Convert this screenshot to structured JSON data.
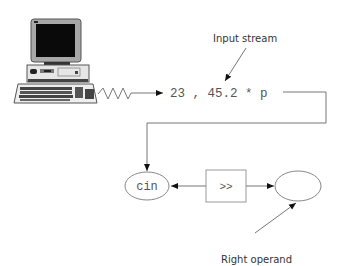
{
  "diagram": {
    "input_stream_label": "Input stream",
    "stream_content": "23 , 45.2 * p",
    "left_operand_label": "cin",
    "operator_label": ">>",
    "right_operand_label": "Right operand",
    "icons": {
      "computer": "desktop-computer-icon",
      "signal": "zigzag-signal-icon"
    },
    "colors": {
      "line": "#777777",
      "text": "#555555",
      "monitor_screen": "#0a0a0a",
      "monitor_bezel": "#9a9a9a"
    }
  }
}
